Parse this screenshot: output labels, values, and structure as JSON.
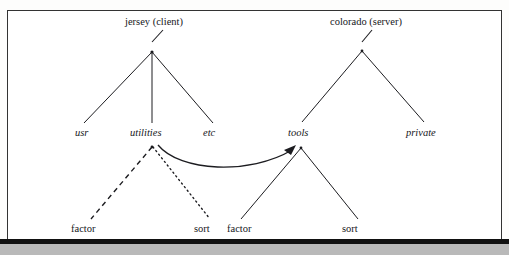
{
  "figure": {
    "frame": {
      "border_color": "#333333",
      "background": "#ffffff"
    },
    "bottom_rule_color": "#111111",
    "gray_strip_color": "#b9b9b9",
    "line_color": "#1c1c20"
  },
  "trees": [
    {
      "id": "client-tree",
      "root": {
        "label": "jersey (client)",
        "style": "roman",
        "x": 160,
        "y": 23
      },
      "children": [
        {
          "label": "usr",
          "style": "italic",
          "x": 86,
          "y": 133
        },
        {
          "label": "utilities",
          "style": "italic",
          "x": 152,
          "y": 133
        },
        {
          "label": "etc",
          "style": "italic",
          "x": 214,
          "y": 133
        }
      ],
      "grandchildren": [
        {
          "label": "factor",
          "style": "roman",
          "x": 92,
          "y": 229,
          "edge": "dashed",
          "parent": "utilities"
        },
        {
          "label": "sort",
          "style": "roman",
          "x": 208,
          "y": 229,
          "edge": "dotted",
          "parent": "utilities"
        }
      ]
    },
    {
      "id": "server-tree",
      "root": {
        "label": "colorado (server)",
        "style": "roman",
        "x": 371,
        "y": 23
      },
      "children": [
        {
          "label": "tools",
          "style": "italic",
          "x": 300,
          "y": 133
        },
        {
          "label": "private",
          "style": "italic",
          "x": 424,
          "y": 133
        }
      ],
      "grandchildren": [
        {
          "label": "factor",
          "style": "roman",
          "x": 247,
          "y": 229,
          "edge": "solid",
          "parent": "tools"
        },
        {
          "label": "sort",
          "style": "roman",
          "x": 355,
          "y": 229,
          "edge": "solid",
          "parent": "tools"
        }
      ]
    }
  ],
  "arrow": {
    "name": "mount-arrow",
    "from": "utilities",
    "to": "tools",
    "style": "curved-solid-arrowhead"
  }
}
